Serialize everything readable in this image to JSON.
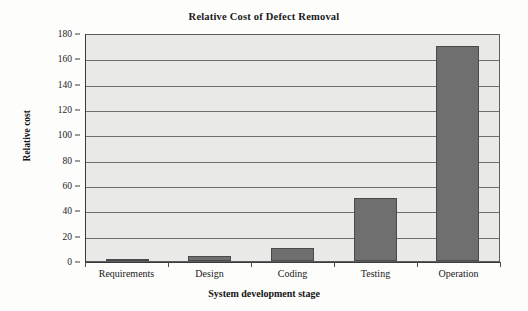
{
  "chart_data": {
    "type": "bar",
    "title": "Relative Cost of Defect Removal",
    "xlabel": "System development stage",
    "ylabel": "Relative cost",
    "categories": [
      "Requirements",
      "Design",
      "Coding",
      "Testing",
      "Operation"
    ],
    "values": [
      1,
      4,
      10,
      50,
      170
    ],
    "ylim": [
      0,
      180
    ],
    "ytick_step": 20,
    "yticks": [
      180,
      160,
      140,
      120,
      100,
      80,
      60,
      40,
      20,
      0
    ],
    "grid": true,
    "legend": false,
    "colors": {
      "bar_fill": "#6f6f6f",
      "bar_border": "#4a4a4a",
      "plot_background": "#e9e9e7",
      "gridline": "#6e6e6e",
      "axis": "#3a3a3a",
      "text": "#1a1a1a",
      "page_background": "#fdfdfc"
    }
  }
}
